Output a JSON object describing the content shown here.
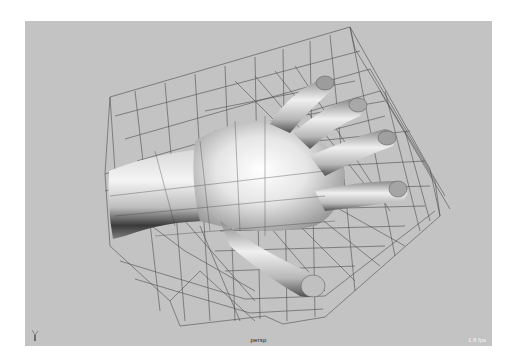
{
  "viewport": {
    "camera_label": "persp",
    "fps_label": "1.8 fps",
    "background_color": "#c3c3c3",
    "axis_indicator": "axis-gizmo-icon",
    "scene": {
      "object": "subdivided hand mesh",
      "display": "smooth shaded with wireframe lattice cage",
      "wire_color": "#3a3a3a"
    }
  }
}
